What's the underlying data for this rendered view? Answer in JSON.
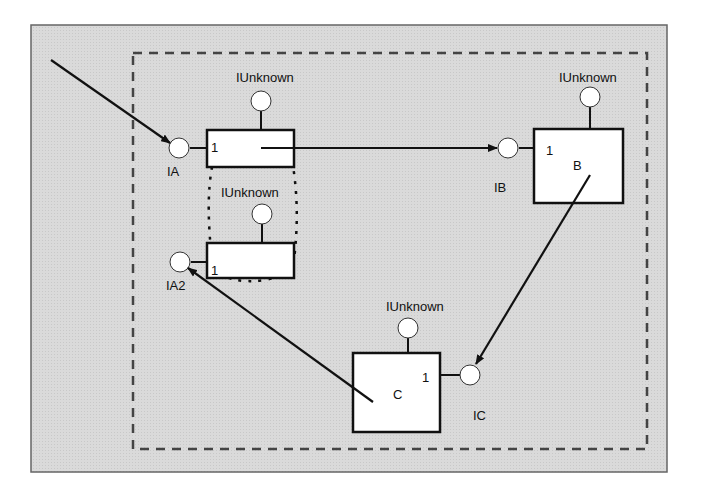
{
  "diagram": {
    "colors": {
      "background": "#d9d9d9",
      "frame": "#555555",
      "ink": "#111111",
      "box_fill": "#ffffff"
    },
    "components": [
      {
        "id": "A1",
        "count_label": "1",
        "name": "",
        "top_interface": "IUnknown",
        "side_interface": "IA"
      },
      {
        "id": "A2",
        "count_label": "1",
        "name": "",
        "top_interface": "IUnknown",
        "side_interface": "IA2"
      },
      {
        "id": "B",
        "count_label": "1",
        "name": "B",
        "top_interface": "IUnknown",
        "side_interface": "IB"
      },
      {
        "id": "C",
        "count_label": "1",
        "name": "C",
        "top_interface": "IUnknown",
        "side_interface": "IC"
      }
    ],
    "arrows": [
      {
        "from": "external",
        "to": "IA"
      },
      {
        "from": "A1",
        "to": "IB"
      },
      {
        "from": "B",
        "to": "IC"
      },
      {
        "from": "C",
        "to": "IA2"
      }
    ]
  }
}
